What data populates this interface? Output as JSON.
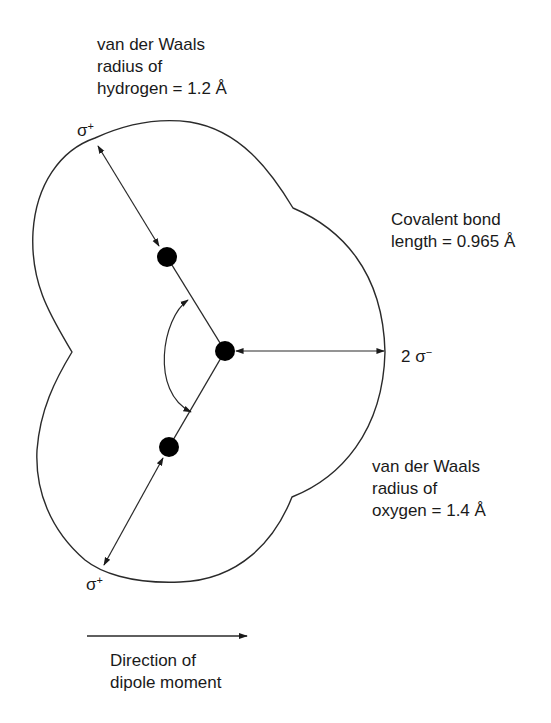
{
  "labels": {
    "hydrogen_radius": [
      "van der Waals",
      "radius of",
      "hydrogen = 1.2 Å"
    ],
    "bond_length": [
      "Covalent bond",
      "length = 0.965 Å"
    ],
    "oxygen_radius": [
      "van der Waals",
      "radius of",
      "oxygen = 1.4 Å"
    ],
    "dipole": [
      "Direction of",
      "dipole moment"
    ]
  },
  "charges": {
    "upper_hydrogen": {
      "symbol": "σ",
      "sign": "+"
    },
    "lower_hydrogen": {
      "symbol": "σ",
      "sign": "+"
    },
    "oxygen": {
      "prefix": "2 ",
      "symbol": "σ",
      "sign": "−"
    }
  },
  "atoms": [
    {
      "name": "hydrogen-upper",
      "x": 167,
      "y": 257
    },
    {
      "name": "oxygen",
      "x": 225,
      "y": 351
    },
    {
      "name": "hydrogen-lower",
      "x": 169,
      "y": 447
    }
  ],
  "values": {
    "hydrogen_vdw_radius_angstrom": 1.2,
    "oxygen_vdw_radius_angstrom": 1.4,
    "covalent_bond_length_angstrom": 0.965
  },
  "colors": {
    "line": "#2a2a2a",
    "atom": "#000000",
    "text": "#1a1a1a"
  }
}
